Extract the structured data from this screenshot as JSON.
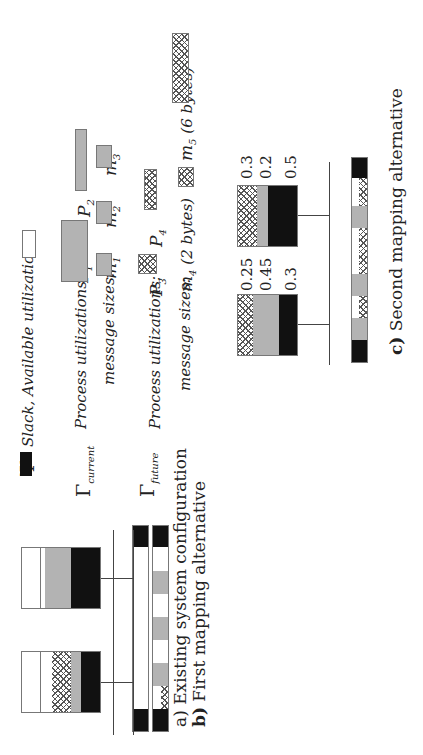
{
  "legend": {
    "psi_symbol": "Ψ",
    "slack_label": "Slack, Available utilization",
    "current": {
      "symbol": "Γ",
      "subscript": "current",
      "process_label": "Process utilizations:",
      "processes": [
        {
          "name": "P",
          "sub": "1"
        },
        {
          "name": "P",
          "sub": "2"
        }
      ],
      "message_label": "message sizes:",
      "messages": [
        {
          "name": "m",
          "sub": "1"
        },
        {
          "name": "m",
          "sub": "2"
        },
        {
          "name": "m",
          "sub": "3"
        }
      ]
    },
    "future": {
      "symbol": "Γ",
      "subscript": "future",
      "process_label": "Process utilizations:",
      "processes": [
        {
          "name": "P",
          "sub": "3"
        },
        {
          "name": "P",
          "sub": "4"
        }
      ],
      "message_label": "message sizes:",
      "messages": [
        {
          "name": "m",
          "sub": "4",
          "note": "(2 bytes)"
        },
        {
          "name": "m",
          "sub": "5",
          "note": "(6 bytes)"
        }
      ]
    }
  },
  "panels": {
    "a": {
      "label": "a)",
      "caption": "Existing system configuration"
    },
    "b": {
      "label": "b)",
      "caption": "First mapping alternative"
    },
    "c": {
      "label": "c)",
      "caption": "Second mapping alternative",
      "node1_values": [
        "0.25",
        "0.45",
        "0.3"
      ],
      "node2_values": [
        "0.3",
        "0.2",
        "0.5"
      ]
    }
  },
  "colors": {
    "psi_black": "#111111",
    "gamma_current_gray": "#b3b3b3",
    "slack_white": "#ffffff",
    "gamma_future_hatch": "#555555"
  }
}
